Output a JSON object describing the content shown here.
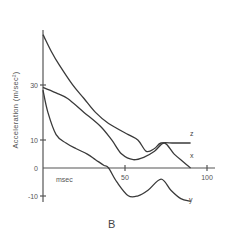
{
  "chart_data": {
    "type": "line",
    "title": "",
    "panel_label": "B",
    "xlabel": "msec",
    "ylabel": "Acceleration  (m/sec²)",
    "xlim": [
      0,
      100
    ],
    "ylim": [
      -10,
      50
    ],
    "x_ticks": [
      50,
      100
    ],
    "y_ticks": [
      -10,
      0,
      10,
      30
    ],
    "grid": false,
    "legend": "inline labels at curve ends",
    "series": [
      {
        "name": "z",
        "x": [
          0,
          5,
          10,
          18,
          25,
          32,
          40,
          52,
          58,
          63,
          68,
          72,
          80,
          90
        ],
        "values": [
          48,
          42,
          37,
          30,
          25,
          20,
          16,
          12,
          10,
          6,
          7,
          9,
          9,
          9
        ]
      },
      {
        "name": "x",
        "x": [
          0,
          8,
          15,
          25,
          35,
          42,
          48,
          55,
          62,
          68,
          74,
          80,
          86,
          90
        ],
        "values": [
          29,
          27,
          25,
          20,
          15,
          10,
          5,
          3,
          4,
          6,
          9,
          5,
          2,
          0
        ]
      },
      {
        "name": "y",
        "x": [
          0,
          3,
          8,
          14,
          20,
          27,
          32,
          37,
          40,
          45,
          52,
          58,
          64,
          72,
          78,
          84,
          90
        ],
        "values": [
          28,
          20,
          12,
          9,
          7,
          5,
          3,
          1,
          0,
          -5,
          -10,
          -10,
          -8,
          -4,
          -8,
          -11,
          -12
        ]
      }
    ]
  },
  "axes": {
    "xlabel": "msec",
    "ylabel": "Acceleration  (m/sec²)",
    "x_tick_labels": [
      "50",
      "100"
    ],
    "y_tick_labels": [
      "30",
      "10",
      "0",
      "-10"
    ]
  },
  "labels": {
    "z": "z",
    "x": "x",
    "y": "y",
    "panel": "B"
  }
}
